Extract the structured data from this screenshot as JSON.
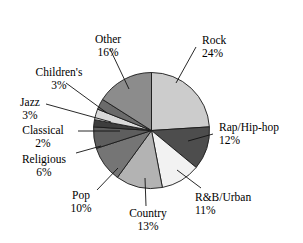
{
  "chart_data": {
    "type": "pie",
    "title": "",
    "subtitle": "",
    "xlabel": "",
    "ylabel": "",
    "legend_position": "none",
    "grid": false,
    "units": "percent",
    "start_angle_deg": 0,
    "direction": "clockwise",
    "categories": [
      "Rock",
      "Rap/Hip-hop",
      "R&B/Urban",
      "Country",
      "Pop",
      "Religious",
      "Classical",
      "Jazz",
      "Children's",
      "Other"
    ],
    "values": [
      24,
      12,
      11,
      13,
      10,
      6,
      2,
      3,
      3,
      16
    ],
    "value_labels": [
      "24%",
      "12%",
      "11%",
      "13%",
      "10%",
      "6%",
      "2%",
      "3%",
      "3%",
      "16%"
    ],
    "colors": [
      "#cccccc",
      "#4d4d4d",
      "#f2f2f2",
      "#b3b3b3",
      "#757575",
      "#5e5e5e",
      "#3d3d3d",
      "#d9d9d9",
      "#6b6b6b",
      "#8c8c8c"
    ],
    "slices": [
      {
        "name": "Rock",
        "value": 24,
        "value_label": "24%",
        "color": "#cccccc"
      },
      {
        "name": "Rap/Hip-hop",
        "value": 12,
        "value_label": "12%",
        "color": "#4d4d4d"
      },
      {
        "name": "R&B/Urban",
        "value": 11,
        "value_label": "11%",
        "color": "#f2f2f2"
      },
      {
        "name": "Country",
        "value": 13,
        "value_label": "13%",
        "color": "#b3b3b3"
      },
      {
        "name": "Pop",
        "value": 10,
        "value_label": "10%",
        "color": "#757575"
      },
      {
        "name": "Religious",
        "value": 6,
        "value_label": "6%",
        "color": "#5e5e5e"
      },
      {
        "name": "Classical",
        "value": 2,
        "value_label": "2%",
        "color": "#3d3d3d"
      },
      {
        "name": "Jazz",
        "value": 3,
        "value_label": "3%",
        "color": "#d9d9d9"
      },
      {
        "name": "Children's",
        "value": 3,
        "value_label": "3%",
        "color": "#6b6b6b"
      },
      {
        "name": "Other",
        "value": 16,
        "value_label": "16%",
        "color": "#8c8c8c"
      }
    ]
  }
}
